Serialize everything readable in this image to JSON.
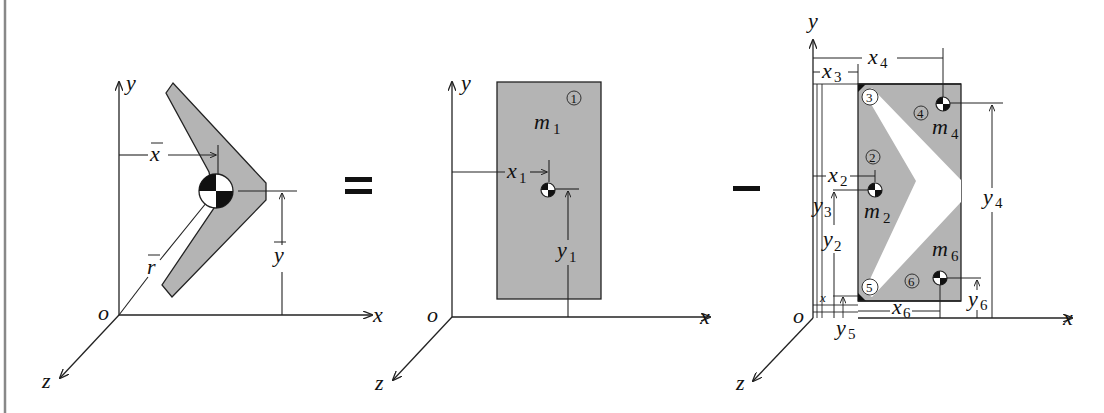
{
  "figure": {
    "colors": {
      "fill": "#b4b4b4",
      "stroke": "#222222",
      "background": "#ffffff",
      "border": "#888888"
    },
    "operators": {
      "equals": "=",
      "minus": "−"
    }
  },
  "panels": [
    {
      "id": "original",
      "axes": {
        "x": "x",
        "y": "y",
        "z": "z",
        "origin": "o"
      },
      "labels": {
        "xbar": "x",
        "ybar": "y",
        "rbar": "r"
      }
    },
    {
      "id": "rectangle",
      "axes": {
        "x": "x",
        "y": "y",
        "z": "z",
        "origin": "o"
      },
      "labels": {
        "mass": "m",
        "mass_sub": "1",
        "part_number": "1",
        "x_dim": "x",
        "x_dim_sub": "1",
        "y_dim": "y",
        "y_dim_sub": "1"
      }
    },
    {
      "id": "removed-parts",
      "axes": {
        "x": "x",
        "y": "y",
        "z": "z",
        "origin": "o"
      },
      "parts": [
        {
          "number": "2",
          "mass": "m",
          "mass_sub": "2",
          "x": "x",
          "x_sub": "2",
          "y": "y",
          "y_sub": "2"
        },
        {
          "number": "3",
          "x": "x",
          "x_sub": "3",
          "y": "y",
          "y_sub": "3"
        },
        {
          "number": "4",
          "mass": "m",
          "mass_sub": "4",
          "x": "x",
          "x_sub": "4",
          "y": "y",
          "y_sub": "4"
        },
        {
          "number": "5",
          "x": "x",
          "x_sub": "5",
          "y": "y",
          "y_sub": "5"
        },
        {
          "number": "6",
          "mass": "m",
          "mass_sub": "6",
          "x": "x",
          "x_sub": "6",
          "y": "y",
          "y_sub": "6"
        }
      ]
    }
  ]
}
